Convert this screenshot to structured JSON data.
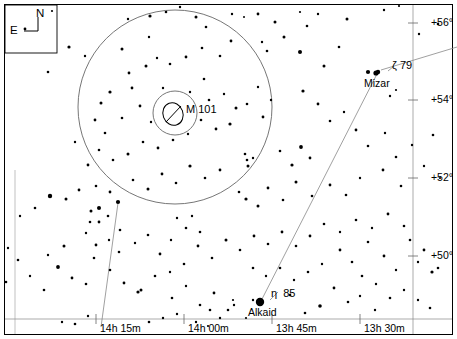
{
  "chart_data": {
    "type": "scatter",
    "title": "",
    "subtitle": "",
    "xlabel": "Right Ascension",
    "ylabel": "Declination",
    "grid": false,
    "legend": null,
    "projection": "equatorial star chart",
    "xlim": [
      "14h 22m",
      "13h 24m"
    ],
    "ylim": [
      49.0,
      57.0
    ],
    "x_tick_labels": [
      "14h 15m",
      "14h 00m",
      "13h 45m",
      "13h 30m"
    ],
    "x_tick_px": [
      128,
      216,
      304,
      392
    ],
    "y_tick_labels": [
      "+56°",
      "+54°",
      "+52°",
      "+50°"
    ],
    "y_tick_px": [
      23,
      100,
      178,
      256
    ],
    "annotations": [
      {
        "name": "M 101",
        "type": "deep-sky-galaxy",
        "x": 176,
        "y": 113,
        "label": "M 101"
      },
      {
        "name": "Mizar",
        "type": "star",
        "x": 376,
        "y": 73,
        "label": "Mizar",
        "greek": "ζ",
        "flamsteed": "79"
      },
      {
        "name": "Alkaid",
        "type": "star",
        "x": 260,
        "y": 302,
        "label": "Alkaid",
        "greek": "η",
        "flamsteed": "85"
      }
    ],
    "field_circles": [
      {
        "name": "finder-field",
        "cx": 175,
        "cy": 107,
        "r": 97
      },
      {
        "name": "eyepiece-field",
        "cx": 175,
        "cy": 113,
        "r": 22
      }
    ],
    "constellation_lines": [
      {
        "from": "Alkaid",
        "to": "Mizar",
        "x1": 261,
        "y1": 301,
        "x2": 378,
        "y2": 72
      },
      {
        "from": "Mizar",
        "to": "edge-ne",
        "x1": 381,
        "y1": 71,
        "x2": 457,
        "y2": 47
      },
      {
        "from": "edge-sw",
        "to": "inner",
        "x1": 118,
        "y1": 203,
        "x2": 101,
        "y2": 327
      }
    ],
    "stars": [
      [
        25,
        29,
        1.4
      ],
      [
        52,
        11,
        1.1
      ],
      [
        69,
        47,
        1.6
      ],
      [
        85,
        56,
        1.2
      ],
      [
        48,
        72,
        1.3
      ],
      [
        128,
        19,
        1.2
      ],
      [
        122,
        49,
        1.5
      ],
      [
        129,
        73,
        1.4
      ],
      [
        150,
        16,
        1.6
      ],
      [
        149,
        37,
        1.2
      ],
      [
        166,
        12,
        1.3
      ],
      [
        180,
        7,
        1.2
      ],
      [
        196,
        17,
        1.5
      ],
      [
        206,
        27,
        1.3
      ],
      [
        232,
        14,
        1.2
      ],
      [
        244,
        17,
        1.0
      ],
      [
        258,
        14,
        1.4
      ],
      [
        275,
        22,
        1.5
      ],
      [
        300,
        12,
        1.1
      ],
      [
        307,
        26,
        1.3
      ],
      [
        318,
        14,
        1.2
      ],
      [
        347,
        19,
        1.5
      ],
      [
        384,
        10,
        1.2
      ],
      [
        399,
        6,
        1.1
      ],
      [
        419,
        34,
        1.2
      ],
      [
        438,
        24,
        1.3
      ],
      [
        300,
        52,
        2.0
      ],
      [
        324,
        66,
        1.5
      ],
      [
        339,
        47,
        1.3
      ],
      [
        368,
        72,
        2.1
      ],
      [
        378,
        72,
        2.2
      ],
      [
        390,
        96,
        1.2
      ],
      [
        396,
        90,
        1.1
      ],
      [
        284,
        37,
        1.5
      ],
      [
        267,
        51,
        1.3
      ],
      [
        262,
        42,
        1.2
      ],
      [
        231,
        41,
        1.4
      ],
      [
        220,
        56,
        1.3
      ],
      [
        202,
        48,
        1.3
      ],
      [
        186,
        57,
        1.4
      ],
      [
        170,
        64,
        1.3
      ],
      [
        157,
        58,
        1.2
      ],
      [
        146,
        66,
        1.5
      ],
      [
        132,
        88,
        1.4
      ],
      [
        110,
        92,
        1.6
      ],
      [
        101,
        103,
        1.5
      ],
      [
        95,
        120,
        1.4
      ],
      [
        105,
        133,
        1.3
      ],
      [
        122,
        118,
        1.3
      ],
      [
        140,
        106,
        1.4
      ],
      [
        151,
        122,
        1.2
      ],
      [
        163,
        88,
        1.2
      ],
      [
        190,
        92,
        1.2
      ],
      [
        204,
        79,
        1.3
      ],
      [
        209,
        100,
        1.3
      ],
      [
        224,
        94,
        1.2
      ],
      [
        236,
        108,
        1.5
      ],
      [
        247,
        104,
        1.3
      ],
      [
        258,
        87,
        1.2
      ],
      [
        271,
        100,
        1.2
      ],
      [
        263,
        117,
        1.4
      ],
      [
        230,
        124,
        1.6
      ],
      [
        216,
        129,
        1.4
      ],
      [
        201,
        120,
        1.3
      ],
      [
        188,
        134,
        1.2
      ],
      [
        173,
        140,
        1.3
      ],
      [
        158,
        148,
        1.4
      ],
      [
        143,
        142,
        1.3
      ],
      [
        128,
        154,
        1.5
      ],
      [
        113,
        160,
        1.3
      ],
      [
        99,
        150,
        1.3
      ],
      [
        88,
        165,
        1.4
      ],
      [
        75,
        142,
        1.2
      ],
      [
        303,
        91,
        1.6
      ],
      [
        318,
        104,
        1.4
      ],
      [
        330,
        121,
        1.3
      ],
      [
        344,
        112,
        1.2
      ],
      [
        356,
        130,
        1.4
      ],
      [
        301,
        147,
        1.9
      ],
      [
        310,
        158,
        1.4
      ],
      [
        292,
        165,
        1.6
      ],
      [
        280,
        151,
        1.3
      ],
      [
        368,
        146,
        1.3
      ],
      [
        385,
        133,
        1.2
      ],
      [
        396,
        157,
        1.3
      ],
      [
        412,
        145,
        1.2
      ],
      [
        433,
        135,
        1.3
      ],
      [
        424,
        166,
        1.2
      ],
      [
        440,
        178,
        1.1
      ],
      [
        401,
        186,
        1.3
      ],
      [
        383,
        170,
        1.4
      ],
      [
        360,
        178,
        1.2
      ],
      [
        346,
        195,
        1.3
      ],
      [
        330,
        185,
        1.4
      ],
      [
        312,
        196,
        1.3
      ],
      [
        296,
        182,
        1.5
      ],
      [
        283,
        200,
        1.3
      ],
      [
        268,
        188,
        1.4
      ],
      [
        258,
        206,
        1.5
      ],
      [
        246,
        199,
        1.6
      ],
      [
        239,
        192,
        1.3
      ],
      [
        220,
        170,
        1.4
      ],
      [
        205,
        178,
        1.3
      ],
      [
        190,
        166,
        1.6
      ],
      [
        176,
        183,
        1.3
      ],
      [
        162,
        174,
        1.4
      ],
      [
        148,
        189,
        1.5
      ],
      [
        133,
        180,
        1.3
      ],
      [
        118,
        202,
        2.1
      ],
      [
        110,
        192,
        1.4
      ],
      [
        96,
        186,
        1.3
      ],
      [
        79,
        190,
        1.4
      ],
      [
        66,
        199,
        1.5
      ],
      [
        50,
        196,
        2.2
      ],
      [
        35,
        208,
        1.3
      ],
      [
        20,
        216,
        1.2
      ],
      [
        91,
        211,
        1.5
      ],
      [
        99,
        208,
        2.0
      ],
      [
        90,
        222,
        1.3
      ],
      [
        99,
        222,
        1.4
      ],
      [
        108,
        216,
        1.3
      ],
      [
        86,
        233,
        1.2
      ],
      [
        96,
        245,
        1.4
      ],
      [
        94,
        258,
        1.3
      ],
      [
        109,
        240,
        1.2
      ],
      [
        120,
        230,
        1.3
      ],
      [
        119,
        252,
        1.3
      ],
      [
        135,
        243,
        1.2
      ],
      [
        148,
        235,
        1.3
      ],
      [
        160,
        254,
        1.4
      ],
      [
        171,
        240,
        1.2
      ],
      [
        64,
        246,
        1.5
      ],
      [
        58,
        267,
        1.9
      ],
      [
        48,
        255,
        1.2
      ],
      [
        72,
        278,
        1.4
      ],
      [
        86,
        284,
        1.3
      ],
      [
        44,
        290,
        1.3
      ],
      [
        30,
        276,
        1.2
      ],
      [
        18,
        260,
        1.3
      ],
      [
        8,
        248,
        1.2
      ],
      [
        6,
        282,
        1.3
      ],
      [
        110,
        270,
        1.3
      ],
      [
        124,
        283,
        1.4
      ],
      [
        138,
        292,
        1.6
      ],
      [
        141,
        290,
        1.5
      ],
      [
        155,
        276,
        1.3
      ],
      [
        172,
        298,
        1.3
      ],
      [
        186,
        286,
        1.2
      ],
      [
        200,
        305,
        1.3
      ],
      [
        214,
        293,
        1.4
      ],
      [
        228,
        310,
        1.3
      ],
      [
        62,
        322,
        1.2
      ],
      [
        75,
        324,
        1.3
      ],
      [
        88,
        316,
        1.2
      ],
      [
        149,
        322,
        1.3
      ],
      [
        163,
        318,
        1.2
      ],
      [
        177,
        314,
        1.2
      ],
      [
        196,
        322,
        1.2
      ],
      [
        210,
        310,
        1.3
      ],
      [
        233,
        300,
        1.1
      ],
      [
        253,
        300,
        1.2
      ],
      [
        260,
        302,
        3.3
      ],
      [
        290,
        295,
        1.3
      ],
      [
        305,
        313,
        1.3
      ],
      [
        320,
        306,
        1.8
      ],
      [
        334,
        288,
        1.4
      ],
      [
        348,
        302,
        1.3
      ],
      [
        360,
        296,
        1.2
      ],
      [
        375,
        310,
        1.2
      ],
      [
        340,
        250,
        1.4
      ],
      [
        352,
        262,
        1.3
      ],
      [
        368,
        242,
        1.3
      ],
      [
        384,
        256,
        1.4
      ],
      [
        396,
        270,
        1.2
      ],
      [
        410,
        240,
        1.3
      ],
      [
        424,
        250,
        1.4
      ],
      [
        418,
        262,
        1.2
      ],
      [
        432,
        272,
        1.6
      ],
      [
        438,
        268,
        1.3
      ],
      [
        404,
        226,
        1.3
      ],
      [
        388,
        214,
        1.4
      ],
      [
        372,
        228,
        1.2
      ],
      [
        356,
        220,
        1.3
      ],
      [
        340,
        232,
        1.2
      ],
      [
        324,
        224,
        1.3
      ],
      [
        310,
        236,
        1.4
      ],
      [
        296,
        246,
        1.3
      ],
      [
        282,
        232,
        1.4
      ],
      [
        268,
        244,
        1.3
      ],
      [
        254,
        236,
        1.4
      ],
      [
        240,
        250,
        1.3
      ],
      [
        226,
        240,
        1.5
      ],
      [
        212,
        258,
        1.3
      ],
      [
        198,
        246,
        1.4
      ],
      [
        184,
        264,
        1.3
      ],
      [
        170,
        272,
        1.2
      ],
      [
        253,
        268,
        1.3
      ],
      [
        266,
        276,
        1.2
      ],
      [
        280,
        268,
        1.3
      ],
      [
        294,
        280,
        1.2
      ],
      [
        308,
        272,
        1.3
      ],
      [
        322,
        264,
        1.2
      ],
      [
        418,
        300,
        1.2
      ],
      [
        430,
        308,
        1.3
      ],
      [
        404,
        290,
        1.2
      ],
      [
        390,
        298,
        1.3
      ],
      [
        376,
        284,
        1.2
      ],
      [
        362,
        276,
        1.3
      ],
      [
        247,
        160,
        1.3
      ],
      [
        248,
        166,
        1.5
      ],
      [
        253,
        158,
        1.2
      ],
      [
        245,
        154,
        1.3
      ],
      [
        177,
        218,
        1.2
      ],
      [
        186,
        228,
        1.3
      ],
      [
        192,
        216,
        1.2
      ],
      [
        200,
        232,
        1.3
      ],
      [
        234,
        305,
        1.2
      ],
      [
        220,
        318,
        1.2
      ],
      [
        208,
        326,
        1.1
      ],
      [
        246,
        318,
        1.1
      ]
    ]
  },
  "compass": {
    "north_label": "N",
    "east_label": "E"
  },
  "frame": {
    "border_color": "#000000",
    "star_color": "#000000",
    "circle_color": "#555555",
    "line_color": "#777777",
    "background": "#ffffff"
  },
  "axes": {
    "dec_labels": [
      {
        "text": "+56°",
        "top": 17,
        "right": 4
      },
      {
        "text": "+54°",
        "top": 94,
        "right": 4
      },
      {
        "text": "+52°",
        "top": 172,
        "right": 4
      },
      {
        "text": "+50°",
        "top": 250,
        "right": 4
      }
    ],
    "ra_labels": [
      {
        "text": "14h 15m",
        "left": 100,
        "top": 323
      },
      {
        "text": "14h 00m",
        "left": 188,
        "top": 323
      },
      {
        "text": "13h 45m",
        "left": 276,
        "top": 323
      },
      {
        "text": "13h 30m",
        "left": 364,
        "top": 323
      }
    ]
  },
  "objects": {
    "m101_label": "M 101",
    "mizar_name": "Mizar",
    "mizar_greek": "ζ",
    "mizar_flamsteed": "79",
    "alkaid_name": "Alkaid",
    "alkaid_greek": "η",
    "alkaid_flamsteed": "85"
  }
}
